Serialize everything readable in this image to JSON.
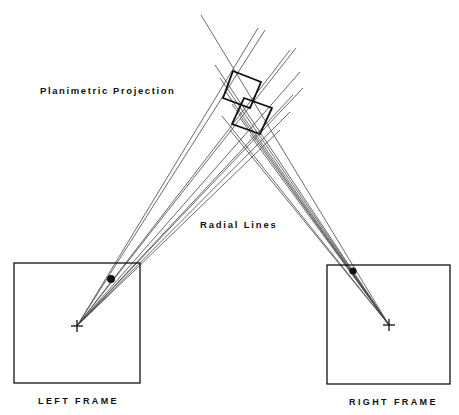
{
  "labels": {
    "planimetric_projection": "Planimetric Projection",
    "radial_lines": "Radial Lines",
    "left_frame": "LEFT FRAME",
    "right_frame": "RIGHT FRAME"
  },
  "colors": {
    "background": "#ffffff",
    "ink": "#111111",
    "ray": "#444444"
  },
  "frames": {
    "left": {
      "x": 14,
      "y": 263,
      "w": 126,
      "h": 120,
      "principal_point": [
        77,
        326
      ],
      "image_point": [
        111,
        279
      ]
    },
    "right": {
      "x": 327,
      "y": 265,
      "w": 123,
      "h": 119,
      "principal_point": [
        389,
        325
      ],
      "image_point": [
        353,
        271
      ]
    }
  },
  "projection": {
    "upper_square": [
      [
        233,
        71
      ],
      [
        261,
        82
      ],
      [
        250,
        108
      ],
      [
        223,
        98
      ]
    ],
    "lower_square": [
      [
        244,
        98
      ],
      [
        272,
        108
      ],
      [
        260,
        134
      ],
      [
        232,
        124
      ]
    ]
  },
  "rays_left": [
    [
      258,
      28
    ],
    [
      265,
      30
    ],
    [
      290,
      50
    ],
    [
      296,
      48
    ],
    [
      300,
      72
    ],
    [
      303,
      88
    ],
    [
      293,
      95
    ],
    [
      290,
      112
    ],
    [
      280,
      130
    ]
  ],
  "rays_right": [
    [
      201,
      15
    ],
    [
      215,
      65
    ],
    [
      220,
      78
    ],
    [
      226,
      92
    ],
    [
      232,
      104
    ],
    [
      222,
      116
    ],
    [
      230,
      130
    ],
    [
      240,
      118
    ],
    [
      250,
      135
    ]
  ]
}
